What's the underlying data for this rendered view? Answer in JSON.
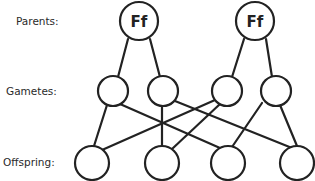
{
  "rows": {
    "parents_label": "Parents:",
    "gametes_label": "Gametes:",
    "offspring_label": "Offspring:"
  },
  "parents": [
    {
      "genotype": "Ff"
    },
    {
      "genotype": "Ff"
    }
  ],
  "gametes": [
    {
      "allele": ""
    },
    {
      "allele": ""
    },
    {
      "allele": ""
    },
    {
      "allele": ""
    }
  ],
  "offspring": [
    {
      "genotype": ""
    },
    {
      "genotype": ""
    },
    {
      "genotype": ""
    },
    {
      "genotype": ""
    }
  ],
  "connections": {
    "parent_to_gamete": [
      [
        0,
        0
      ],
      [
        0,
        1
      ],
      [
        1,
        2
      ],
      [
        1,
        3
      ]
    ],
    "gamete_to_offspring": [
      [
        0,
        0
      ],
      [
        0,
        2
      ],
      [
        1,
        1
      ],
      [
        1,
        3
      ],
      [
        2,
        0
      ],
      [
        2,
        2
      ],
      [
        3,
        1
      ],
      [
        3,
        3
      ]
    ]
  }
}
